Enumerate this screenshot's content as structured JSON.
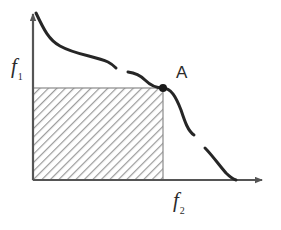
{
  "figure": {
    "background_color": "#ffffff",
    "axes": {
      "origin": {
        "x": 33,
        "y": 180
      },
      "x_axis": {
        "name": "f2-axis",
        "label_base": "f",
        "label_sub": "2",
        "start_x": 33,
        "end_x": 268,
        "y": 180,
        "color": "#555555",
        "arrow": true
      },
      "y_axis": {
        "name": "f1-axis",
        "label_base": "f",
        "label_sub": "1",
        "x": 33,
        "start_y": 180,
        "end_y": 8,
        "color": "#555555",
        "arrow": true
      }
    },
    "annotations": {
      "point_a_label": "A",
      "point_a": {
        "x": 163,
        "y": 88
      },
      "point_a_radius": 4,
      "point_color": "#1a1a1a"
    },
    "dominated_region": {
      "name": "hatched-rectangle",
      "x": 33,
      "y": 88,
      "width": 130,
      "height": 92,
      "hatch_color": "#9a9a9a",
      "border_color": "#8a8a8a",
      "fill_color": "#ffffff"
    },
    "curve": {
      "name": "pareto-front",
      "color": "#262626",
      "stroke_width": 3,
      "discontinuous": true,
      "segments": [
        {
          "id": "segment-1",
          "path": "M 36,13 C 44,30 49,40 60,46 C 76,55 95,56 108,62 C 112,64 114,66 116,68"
        },
        {
          "id": "segment-2",
          "path": "M 128,72 C 136,73 141,76 145,80 C 151,86 156,88 163,88 C 171,88 176,97 181,110 C 185,122 188,131 194,135"
        },
        {
          "id": "segment-3",
          "path": "M 205,148 C 212,155 219,165 226,173 C 230,177 233,179 236,180"
        }
      ]
    }
  },
  "chart_data": {
    "type": "line",
    "title": "",
    "xlabel": "f2",
    "ylabel": "f1",
    "legend": [],
    "grid": false,
    "annotations": [
      {
        "label": "A",
        "x": 163,
        "y": 88,
        "description": "point on Pareto front"
      }
    ],
    "series": [
      {
        "name": "pareto-front-segment-1",
        "points": [
          [
            36,
            13
          ],
          [
            48,
            39
          ],
          [
            60,
            46
          ],
          [
            80,
            55
          ],
          [
            100,
            60
          ],
          [
            116,
            68
          ]
        ]
      },
      {
        "name": "pareto-front-segment-2",
        "points": [
          [
            128,
            72
          ],
          [
            142,
            77
          ],
          [
            152,
            85
          ],
          [
            163,
            88
          ],
          [
            174,
            99
          ],
          [
            184,
            121
          ],
          [
            194,
            135
          ]
        ]
      },
      {
        "name": "pareto-front-segment-3",
        "points": [
          [
            205,
            148
          ],
          [
            216,
            160
          ],
          [
            226,
            173
          ],
          [
            236,
            180
          ]
        ]
      }
    ],
    "shaded_regions": [
      {
        "name": "dominated-region",
        "style": "diagonal-hatch",
        "x0": 33,
        "y0": 88,
        "x1": 163,
        "y1": 180
      }
    ]
  }
}
